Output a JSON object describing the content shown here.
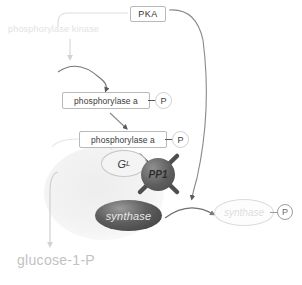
{
  "diagram": {
    "colors": {
      "box_border": "#b9b9b9",
      "text_dark": "#3a3a3a",
      "faded_text": "#e2e2e2",
      "glucose_text": "#c2c2c2",
      "pp1_fill": "#5d5d5d",
      "synthase_fill": "#3c3c3c",
      "arrow_dark": "#6a6a6a",
      "arrow_light": "#d8d8d8"
    },
    "nodes": {
      "pka": "PKA",
      "phosphorylase_kinase": "phosphorylase kinase",
      "phosphorylase_a_1": "phosphorylase a",
      "phosphorylase_a_2": "phosphorylase a",
      "gl": "G",
      "gl_sub": "L",
      "pp1": "PP1",
      "synthase": "synthase",
      "synthase_inactive": "synthase",
      "glucose_1_p": "glucose-1-P",
      "phosphate_1": "P",
      "phosphate_2": "P",
      "phosphate_3": "P"
    },
    "icons": {
      "cross_out": "pp1-crossed-out-icon",
      "phosphate": "phosphate-circle-icon"
    }
  }
}
